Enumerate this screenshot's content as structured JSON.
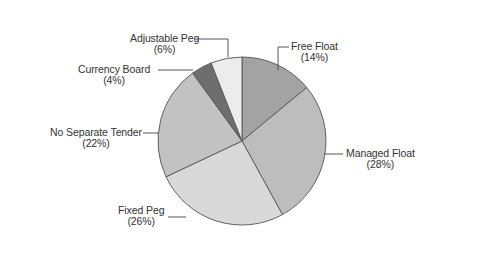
{
  "chart_data": {
    "type": "pie",
    "title": "",
    "start_angle": "12 o'clock, clockwise",
    "categories": [
      "Free Float",
      "Managed Float",
      "Fixed Peg",
      "No Separate Tender",
      "Currency Board",
      "Adjustable Peg"
    ],
    "values": [
      14,
      28,
      26,
      22,
      4,
      6
    ],
    "unit": "%",
    "colors": [
      "#a3a3a3",
      "#bdbdbd",
      "#d9d9d9",
      "#c2c2c2",
      "#6e6e6e",
      "#ececec"
    ],
    "legend": "none (leader-line labels)"
  },
  "labels": [
    {
      "name": "Free Float",
      "pct": "(14%)"
    },
    {
      "name": "Managed Float",
      "pct": "(28%)"
    },
    {
      "name": "Fixed Peg",
      "pct": "(26%)"
    },
    {
      "name": "No Separate Tender",
      "pct": "(22%)"
    },
    {
      "name": "Currency Board",
      "pct": "(4%)"
    },
    {
      "name": "Adjustable Peg",
      "pct": "(6%)"
    }
  ]
}
